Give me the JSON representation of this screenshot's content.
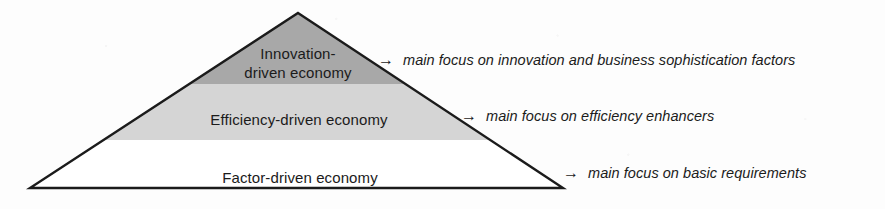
{
  "diagram": {
    "type": "pyramid",
    "arrow_glyph": "→",
    "colors": {
      "tier_innovation_fill": "#a8a8a8",
      "tier_efficiency_fill": "#d5d5d5",
      "tier_factor_fill": "#ffffff",
      "outline": "#1b1b1b",
      "text": "#1b1b1b",
      "background": "#fdfdfd"
    },
    "tiers": [
      {
        "id": "innovation",
        "label_lines": [
          "Innovation-",
          "driven economy"
        ],
        "label": "Innovation-driven economy",
        "annotation": "main focus on innovation and business sophistication factors"
      },
      {
        "id": "efficiency",
        "label_lines": [
          "Efficiency-driven economy"
        ],
        "label": "Efficiency-driven economy",
        "annotation": "main focus on efficiency enhancers"
      },
      {
        "id": "factor",
        "label_lines": [
          "Factor-driven economy"
        ],
        "label": "Factor-driven economy",
        "annotation": "main focus on basic requirements"
      }
    ]
  }
}
